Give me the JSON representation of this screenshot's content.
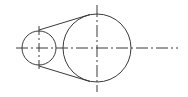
{
  "diagram": {
    "type": "belt-pulley-drawing",
    "stroke_color": "#3a3a3a",
    "centerline": {
      "y": 48,
      "x1": 16,
      "x2": 178
    },
    "small_pulley": {
      "cx": 39,
      "cy": 48,
      "r": 17
    },
    "large_pulley": {
      "cx": 97,
      "cy": 48,
      "r": 34
    },
    "belt_segments": [
      "upper-tangent",
      "lower-tangent"
    ]
  }
}
